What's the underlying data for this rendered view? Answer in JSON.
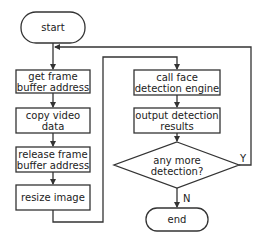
{
  "diagram": {
    "type": "flowchart",
    "colors": {
      "stroke": "#333333",
      "fill": "#ffffff",
      "text": "#222222"
    },
    "nodes": {
      "start": {
        "shape": "terminal",
        "label": "start"
      },
      "get_frame": {
        "shape": "process",
        "line1": "get frame",
        "line2": "buffer address"
      },
      "copy_video": {
        "shape": "process",
        "line1": "copy video",
        "line2": "data"
      },
      "release_frame": {
        "shape": "process",
        "line1": "release frame",
        "line2": "buffer address"
      },
      "resize_image": {
        "shape": "process",
        "label": "resize image"
      },
      "call_face": {
        "shape": "process",
        "line1": "call face",
        "line2": "detection engine"
      },
      "output_detection": {
        "shape": "process",
        "line1": "output detection",
        "line2": "results"
      },
      "any_more": {
        "shape": "decision",
        "line1": "any more",
        "line2": "detection?"
      },
      "end": {
        "shape": "terminal",
        "label": "end"
      }
    },
    "edge_labels": {
      "yes": "Y",
      "no": "N"
    },
    "edges": [
      [
        "start",
        "get_frame"
      ],
      [
        "get_frame",
        "copy_video"
      ],
      [
        "copy_video",
        "release_frame"
      ],
      [
        "release_frame",
        "resize_image"
      ],
      [
        "resize_image",
        "call_face"
      ],
      [
        "call_face",
        "output_detection"
      ],
      [
        "output_detection",
        "any_more"
      ],
      [
        "any_more",
        "get_frame",
        "Y"
      ],
      [
        "any_more",
        "end",
        "N"
      ]
    ]
  }
}
